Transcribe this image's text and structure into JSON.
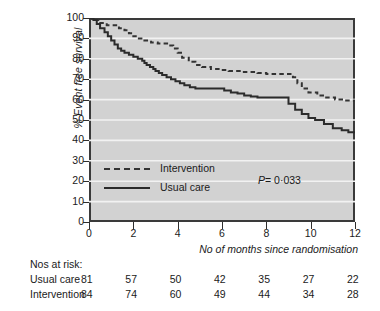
{
  "chart_data": {
    "type": "line",
    "subtype": "kaplan-meier-step",
    "title": "",
    "xlabel": "No of months since randomisation",
    "ylabel": "% Event free survival",
    "xlim": [
      0,
      12
    ],
    "ylim": [
      0,
      100
    ],
    "xticks": [
      0,
      2,
      4,
      6,
      8,
      10,
      12
    ],
    "yticks": [
      0,
      10,
      20,
      30,
      40,
      50,
      60,
      70,
      80,
      90,
      100
    ],
    "grid": "horizontal-white",
    "legend_position": "inside-lower-left",
    "annotation": "P = 0·033",
    "plot_background": "#d2d2d2",
    "series": [
      {
        "name": "Intervention",
        "style": "dashed",
        "color": "#333333",
        "points": [
          [
            0.0,
            100
          ],
          [
            0.25,
            99
          ],
          [
            0.45,
            97.5
          ],
          [
            0.8,
            96.5
          ],
          [
            1.0,
            96.5
          ],
          [
            1.35,
            95
          ],
          [
            1.6,
            94
          ],
          [
            1.8,
            92.5
          ],
          [
            2.0,
            91
          ],
          [
            2.25,
            90
          ],
          [
            2.5,
            89
          ],
          [
            2.8,
            88
          ],
          [
            3.1,
            87.5
          ],
          [
            3.4,
            87.5
          ],
          [
            3.6,
            86.5
          ],
          [
            3.8,
            85
          ],
          [
            4.0,
            83
          ],
          [
            4.2,
            80.5
          ],
          [
            4.5,
            78.5
          ],
          [
            4.8,
            77
          ],
          [
            5.1,
            76
          ],
          [
            5.5,
            75
          ],
          [
            5.9,
            74.5
          ],
          [
            6.3,
            74
          ],
          [
            6.8,
            73.5
          ],
          [
            7.2,
            73.5
          ],
          [
            7.6,
            73
          ],
          [
            8.0,
            72.5
          ],
          [
            8.5,
            72.5
          ],
          [
            8.9,
            72.5
          ],
          [
            9.2,
            71
          ],
          [
            9.4,
            68
          ],
          [
            9.6,
            65.5
          ],
          [
            9.9,
            63.5
          ],
          [
            10.3,
            62
          ],
          [
            10.7,
            61
          ],
          [
            11.1,
            60
          ],
          [
            11.5,
            59.5
          ],
          [
            12.0,
            59.5
          ]
        ]
      },
      {
        "name": "Usual care",
        "style": "solid",
        "color": "#2b2b2b",
        "points": [
          [
            0.0,
            100
          ],
          [
            0.2,
            99
          ],
          [
            0.35,
            97
          ],
          [
            0.5,
            95
          ],
          [
            0.7,
            93
          ],
          [
            0.85,
            91
          ],
          [
            1.0,
            89
          ],
          [
            1.15,
            87
          ],
          [
            1.3,
            85
          ],
          [
            1.45,
            84
          ],
          [
            1.6,
            83
          ],
          [
            1.8,
            82
          ],
          [
            2.0,
            81
          ],
          [
            2.2,
            80
          ],
          [
            2.4,
            79
          ],
          [
            2.5,
            78
          ],
          [
            2.6,
            77
          ],
          [
            2.75,
            76
          ],
          [
            2.9,
            75
          ],
          [
            3.0,
            74
          ],
          [
            3.15,
            73
          ],
          [
            3.3,
            72
          ],
          [
            3.5,
            71
          ],
          [
            3.7,
            70
          ],
          [
            3.9,
            69
          ],
          [
            4.1,
            68
          ],
          [
            4.3,
            67
          ],
          [
            4.55,
            66
          ],
          [
            4.8,
            65.5
          ],
          [
            5.3,
            65.5
          ],
          [
            5.8,
            65.5
          ],
          [
            6.1,
            64.5
          ],
          [
            6.4,
            63.5
          ],
          [
            6.7,
            63
          ],
          [
            7.0,
            62
          ],
          [
            7.3,
            61.5
          ],
          [
            7.6,
            61
          ],
          [
            8.0,
            61
          ],
          [
            8.4,
            61
          ],
          [
            8.8,
            61
          ],
          [
            9.0,
            58
          ],
          [
            9.3,
            55
          ],
          [
            9.6,
            53
          ],
          [
            9.9,
            51
          ],
          [
            10.2,
            50
          ],
          [
            10.6,
            48
          ],
          [
            11.0,
            46
          ],
          [
            11.4,
            45
          ],
          [
            11.7,
            44
          ],
          [
            12.0,
            44
          ]
        ]
      }
    ]
  },
  "legend": {
    "items": [
      {
        "label": "Intervention",
        "style": "dashed"
      },
      {
        "label": "Usual care",
        "style": "solid"
      }
    ]
  },
  "axes": {
    "y_label": "% Event free survival",
    "x_label": "No of months since randomisation",
    "y_ticks": [
      "100",
      "90",
      "80",
      "70",
      "60",
      "50",
      "40",
      "30",
      "20",
      "10",
      "0"
    ],
    "x_ticks": [
      "0",
      "2",
      "4",
      "6",
      "8",
      "10",
      "12"
    ]
  },
  "pvalue": {
    "prefix": "P",
    "equals": "= 0·033"
  },
  "risk_table": {
    "title": "Nos at risk:",
    "rows": [
      {
        "label": "Usual care",
        "values": [
          "81",
          "57",
          "50",
          "42",
          "35",
          "27",
          "22"
        ]
      },
      {
        "label": "Intervention",
        "values": [
          "84",
          "74",
          "60",
          "49",
          "44",
          "34",
          "28"
        ]
      }
    ]
  }
}
